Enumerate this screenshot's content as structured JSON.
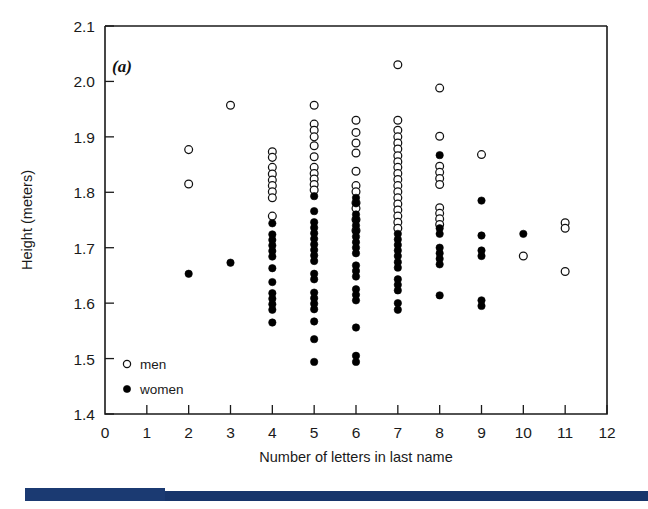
{
  "figure": {
    "panel_label": "(a)",
    "xlabel": "Number of letters in last name",
    "ylabel": "Height (meters)"
  },
  "legend": {
    "position": "inside-lower-left",
    "entries": [
      {
        "label": "men",
        "marker": "open-circle"
      },
      {
        "label": "women",
        "marker": "filled-circle"
      }
    ]
  },
  "axes": {
    "x_ticks": [
      "0",
      "1",
      "2",
      "3",
      "4",
      "5",
      "6",
      "7",
      "8",
      "9",
      "10",
      "11",
      "12"
    ],
    "y_ticks": [
      "1.4",
      "1.5",
      "1.6",
      "1.7",
      "1.8",
      "1.9",
      "2.0",
      "2.1"
    ]
  },
  "colors": {
    "axis": "#1a1a1a",
    "men_marker": "#ffffff",
    "women_marker": "#000000",
    "bottom_bar": "#1b3a72"
  },
  "chart_data": {
    "type": "scatter",
    "title": "(a)",
    "xlabel": "Number of letters in last name",
    "ylabel": "Height (meters)",
    "xlim": [
      0,
      12
    ],
    "ylim": [
      1.4,
      2.1
    ],
    "xticks": [
      0,
      1,
      2,
      3,
      4,
      5,
      6,
      7,
      8,
      9,
      10,
      11,
      12
    ],
    "yticks": [
      1.4,
      1.5,
      1.6,
      1.7,
      1.8,
      1.9,
      2.0,
      2.1
    ],
    "grid": false,
    "legend": [
      "men",
      "women"
    ],
    "legend_position": "lower left inside axes",
    "series": [
      {
        "name": "men",
        "marker": "open-circle",
        "points": [
          [
            2,
            1.877
          ],
          [
            2,
            1.815
          ],
          [
            3,
            1.957
          ],
          [
            4,
            1.873
          ],
          [
            4,
            1.863
          ],
          [
            4,
            1.845
          ],
          [
            4,
            1.833
          ],
          [
            4,
            1.822
          ],
          [
            4,
            1.812
          ],
          [
            4,
            1.801
          ],
          [
            4,
            1.79
          ],
          [
            4,
            1.757
          ],
          [
            5,
            1.957
          ],
          [
            5,
            1.923
          ],
          [
            5,
            1.912
          ],
          [
            5,
            1.9
          ],
          [
            5,
            1.884
          ],
          [
            5,
            1.864
          ],
          [
            5,
            1.845
          ],
          [
            5,
            1.834
          ],
          [
            5,
            1.824
          ],
          [
            5,
            1.814
          ],
          [
            5,
            1.804
          ],
          [
            6,
            1.93
          ],
          [
            6,
            1.908
          ],
          [
            6,
            1.889
          ],
          [
            6,
            1.871
          ],
          [
            6,
            1.838
          ],
          [
            6,
            1.812
          ],
          [
            6,
            1.801
          ],
          [
            6,
            1.781
          ],
          [
            6,
            1.771
          ],
          [
            6,
            1.751
          ],
          [
            6,
            1.731
          ],
          [
            7,
            2.03
          ],
          [
            7,
            1.93
          ],
          [
            7,
            1.912
          ],
          [
            7,
            1.9
          ],
          [
            7,
            1.889
          ],
          [
            7,
            1.878
          ],
          [
            7,
            1.866
          ],
          [
            7,
            1.855
          ],
          [
            7,
            1.845
          ],
          [
            7,
            1.834
          ],
          [
            7,
            1.823
          ],
          [
            7,
            1.812
          ],
          [
            7,
            1.801
          ],
          [
            7,
            1.79
          ],
          [
            7,
            1.779
          ],
          [
            7,
            1.768
          ],
          [
            7,
            1.757
          ],
          [
            7,
            1.746
          ],
          [
            7,
            1.735
          ],
          [
            8,
            1.988
          ],
          [
            8,
            1.901
          ],
          [
            8,
            1.847
          ],
          [
            8,
            1.836
          ],
          [
            8,
            1.825
          ],
          [
            8,
            1.814
          ],
          [
            8,
            1.772
          ],
          [
            8,
            1.762
          ],
          [
            8,
            1.752
          ],
          [
            8,
            1.742
          ],
          [
            9,
            1.868
          ],
          [
            10,
            1.685
          ],
          [
            11,
            1.745
          ],
          [
            11,
            1.735
          ],
          [
            11,
            1.657
          ]
        ]
      },
      {
        "name": "women",
        "marker": "filled-circle",
        "points": [
          [
            2,
            1.653
          ],
          [
            3,
            1.673
          ],
          [
            4,
            1.744
          ],
          [
            4,
            1.724
          ],
          [
            4,
            1.714
          ],
          [
            4,
            1.704
          ],
          [
            4,
            1.694
          ],
          [
            4,
            1.684
          ],
          [
            4,
            1.663
          ],
          [
            4,
            1.638
          ],
          [
            4,
            1.618
          ],
          [
            4,
            1.608
          ],
          [
            4,
            1.598
          ],
          [
            4,
            1.588
          ],
          [
            4,
            1.565
          ],
          [
            5,
            1.793
          ],
          [
            5,
            1.766
          ],
          [
            5,
            1.746
          ],
          [
            5,
            1.736
          ],
          [
            5,
            1.726
          ],
          [
            5,
            1.716
          ],
          [
            5,
            1.706
          ],
          [
            5,
            1.696
          ],
          [
            5,
            1.686
          ],
          [
            5,
            1.676
          ],
          [
            5,
            1.653
          ],
          [
            5,
            1.643
          ],
          [
            5,
            1.619
          ],
          [
            5,
            1.609
          ],
          [
            5,
            1.599
          ],
          [
            5,
            1.589
          ],
          [
            5,
            1.567
          ],
          [
            5,
            1.535
          ],
          [
            5,
            1.494
          ],
          [
            6,
            1.79
          ],
          [
            6,
            1.78
          ],
          [
            6,
            1.76
          ],
          [
            6,
            1.75
          ],
          [
            6,
            1.74
          ],
          [
            6,
            1.73
          ],
          [
            6,
            1.72
          ],
          [
            6,
            1.71
          ],
          [
            6,
            1.7
          ],
          [
            6,
            1.69
          ],
          [
            6,
            1.668
          ],
          [
            6,
            1.658
          ],
          [
            6,
            1.648
          ],
          [
            6,
            1.625
          ],
          [
            6,
            1.615
          ],
          [
            6,
            1.605
          ],
          [
            6,
            1.556
          ],
          [
            6,
            1.505
          ],
          [
            6,
            1.494
          ],
          [
            7,
            1.725
          ],
          [
            7,
            1.715
          ],
          [
            7,
            1.705
          ],
          [
            7,
            1.695
          ],
          [
            7,
            1.685
          ],
          [
            7,
            1.674
          ],
          [
            7,
            1.664
          ],
          [
            7,
            1.643
          ],
          [
            7,
            1.633
          ],
          [
            7,
            1.623
          ],
          [
            7,
            1.6
          ],
          [
            7,
            1.588
          ],
          [
            8,
            1.867
          ],
          [
            8,
            1.735
          ],
          [
            8,
            1.725
          ],
          [
            8,
            1.7
          ],
          [
            8,
            1.69
          ],
          [
            8,
            1.68
          ],
          [
            8,
            1.67
          ],
          [
            8,
            1.614
          ],
          [
            9,
            1.785
          ],
          [
            9,
            1.722
          ],
          [
            9,
            1.695
          ],
          [
            9,
            1.685
          ],
          [
            9,
            1.605
          ],
          [
            9,
            1.595
          ],
          [
            10,
            1.725
          ]
        ]
      }
    ]
  }
}
